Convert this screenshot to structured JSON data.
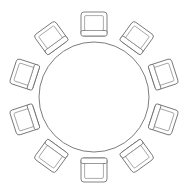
{
  "document": {
    "title": "Round Table Seating Plan",
    "view": "top-down floor plan",
    "style": "line-art line drawing"
  },
  "canvas": {
    "width": 190,
    "height": 196,
    "background_color": "#ffffff"
  },
  "palette": {
    "line_color": "#6e6e6e",
    "inner_line_color": "#8a8a8a",
    "fill_color": "#ffffff"
  },
  "table": {
    "name": "round-table",
    "shape": "circle",
    "center_x": 94,
    "center_y": 97,
    "radius": 55,
    "stroke_width": 0.9
  },
  "seating": {
    "chair_count": 10,
    "angle_step_degrees": 36,
    "start_angle_degrees": -90,
    "orbit_radius": 73,
    "chair": {
      "seat_width": 26,
      "seat_height": 24,
      "corner_radius": 3,
      "inner_inset": 3.6,
      "back_rail_thickness": 5.5,
      "back_rail_position": "outer-edge"
    }
  },
  "chairs": [
    {
      "id": 1,
      "label": "chair-1",
      "angle": -90,
      "cx": 94,
      "cy": 24
    },
    {
      "id": 2,
      "label": "chair-2",
      "angle": -54,
      "cx": 136.9,
      "cy": 37.9
    },
    {
      "id": 3,
      "label": "chair-3",
      "angle": -18,
      "cx": 163.4,
      "cy": 74.4
    },
    {
      "id": 4,
      "label": "chair-4",
      "angle": 18,
      "cx": 163.4,
      "cy": 119.6
    },
    {
      "id": 5,
      "label": "chair-5",
      "angle": 54,
      "cx": 136.9,
      "cy": 156.1
    },
    {
      "id": 6,
      "label": "chair-6",
      "angle": 90,
      "cx": 94,
      "cy": 170
    },
    {
      "id": 7,
      "label": "chair-7",
      "angle": 126,
      "cx": 51.1,
      "cy": 156.1
    },
    {
      "id": 8,
      "label": "chair-8",
      "angle": 162,
      "cx": 24.6,
      "cy": 119.6
    },
    {
      "id": 9,
      "label": "chair-9",
      "angle": 198,
      "cx": 24.6,
      "cy": 74.4
    },
    {
      "id": 10,
      "label": "chair-10",
      "angle": 234,
      "cx": 51.1,
      "cy": 37.9
    }
  ]
}
